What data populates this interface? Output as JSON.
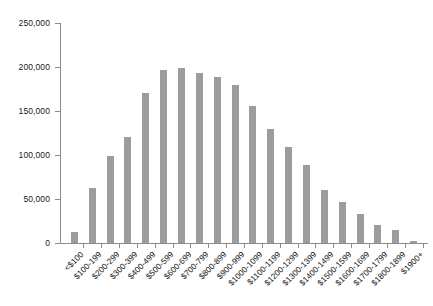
{
  "chart_data": {
    "type": "bar",
    "title": "",
    "subtitle": "",
    "xlabel": "",
    "ylabel": "",
    "legend": [],
    "grid": false,
    "legend_position": "none",
    "bar_color": "#9c9c9c",
    "axis_color": "#8c8c8c",
    "text_color": "#111111",
    "ylim": [
      0,
      250000
    ],
    "y_ticks": [
      0,
      50000,
      100000,
      150000,
      200000,
      250000
    ],
    "y_tick_labels": [
      "0",
      "50,000",
      "100,000",
      "150,000",
      "200,000",
      "250,000"
    ],
    "categories": [
      "<$100",
      "$100-199",
      "$200-299",
      "$300-399",
      "$400-499",
      "$500-599",
      "$600-699",
      "$700-799",
      "$800-899",
      "$900-999",
      "$1000-1099",
      "$1100-1199",
      "$1200-1299",
      "$1300-1399",
      "$1400-1499",
      "$1500-1599",
      "$1600-1699",
      "$1700-1799",
      "$1800-1899",
      "$1900+"
    ],
    "values": [
      13000,
      62000,
      99000,
      121000,
      170000,
      197000,
      199000,
      193000,
      189000,
      180000,
      156000,
      129000,
      109000,
      89000,
      60000,
      47000,
      33000,
      21000,
      15000,
      2000
    ]
  }
}
